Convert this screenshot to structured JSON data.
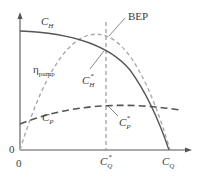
{
  "diagram": {
    "type": "pump performance curves",
    "labels": {
      "head_curve": {
        "main": "C",
        "sub": "H"
      },
      "efficiency_curve": {
        "main": "η",
        "sub": "pump"
      },
      "power_curve": {
        "main": "C",
        "sub": "P"
      },
      "bep": "BEP",
      "head_star": {
        "main": "C",
        "sub": "H",
        "sup": "*"
      },
      "power_star": {
        "main": "C",
        "sub": "P",
        "sup": "*"
      },
      "flow_star": {
        "main": "C",
        "sub": "Q",
        "sup": "*"
      },
      "flow_axis": {
        "main": "C",
        "sub": "Q"
      },
      "origin_y": "0",
      "origin_x": "0"
    },
    "colors": {
      "axis": "#555555",
      "head_curve": "#555555",
      "efficiency_curve": "#aaaaaa",
      "power_curve": "#555555",
      "bep_line": "#777777"
    }
  }
}
